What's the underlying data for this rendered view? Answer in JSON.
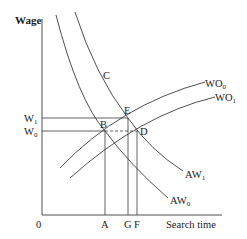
{
  "diagram": {
    "axes": {
      "y_label": "Wage",
      "x_label": "Search time",
      "origin_label": "0"
    },
    "y_ticks": [
      {
        "label": "W",
        "sub": "1",
        "y": 118
      },
      {
        "label": "W",
        "sub": "0",
        "y": 131
      }
    ],
    "x_ticks": [
      {
        "label": "A",
        "x": 105
      },
      {
        "label": "G",
        "x": 128
      },
      {
        "label": "F",
        "x": 137
      }
    ],
    "points": [
      {
        "label": "B",
        "x": 105,
        "y": 131
      },
      {
        "label": "E",
        "x": 128,
        "y": 118
      },
      {
        "label": "D",
        "x": 138,
        "y": 131
      },
      {
        "label": "C",
        "x": 103,
        "y": 75
      }
    ],
    "curves": [
      {
        "name": "WO",
        "sub": "0",
        "kind": "offer-wage",
        "label_x": 207,
        "label_y": 86
      },
      {
        "name": "WO",
        "sub": "1",
        "kind": "offer-wage",
        "label_x": 217,
        "label_y": 101
      },
      {
        "name": "AW",
        "sub": "1",
        "kind": "acceptance-wage",
        "label_x": 186,
        "label_y": 178
      },
      {
        "name": "AW",
        "sub": "0",
        "kind": "acceptance-wage",
        "label_x": 171,
        "label_y": 204
      }
    ],
    "colors": {
      "line": "#3a3a3a",
      "text": "#1a1a1a",
      "background": "#ffffff"
    }
  }
}
